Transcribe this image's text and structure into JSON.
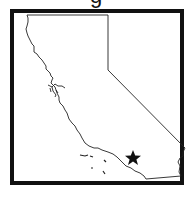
{
  "header": {
    "title_fragment": "g"
  },
  "map": {
    "region": "California",
    "outline_color": "#222222",
    "frame_color": "#111111",
    "background": "#ffffff",
    "marker": {
      "icon": "star-icon",
      "color": "#111111",
      "location": "Southern California (inland, near Palm Springs area)"
    }
  }
}
